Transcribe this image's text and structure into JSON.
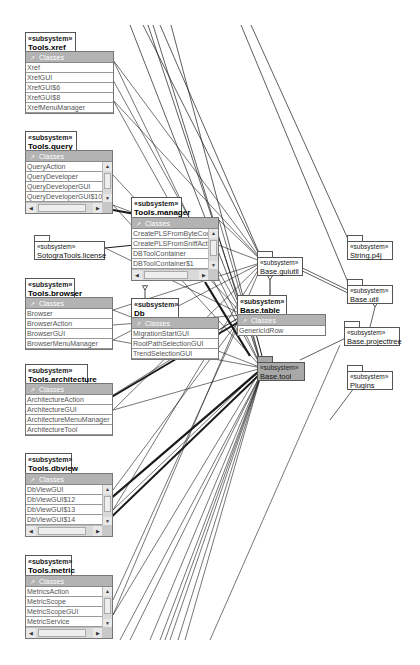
{
  "stereotype": "«subsystem»",
  "classes_label": "Classes",
  "colors": {
    "classes_header": "#b3b3b3",
    "highlight_package": "#a8a8a8",
    "line": "#1a1a1a"
  },
  "packages": [
    {
      "id": "tools_xref",
      "name": "Tools.xref",
      "classes": [
        "Xref",
        "XrefGUI",
        "XrefGUI$6",
        "XrefGUI$8",
        "XrefMenuManager"
      ]
    },
    {
      "id": "tools_query",
      "name": "Tools.query",
      "classes": [
        "QueryAction",
        "QueryDeveloper",
        "QueryDeveloperGUI",
        "QueryDeveloperGUI$10"
      ]
    },
    {
      "id": "tools_manager",
      "name": "Tools.manager",
      "classes": [
        "CreatePLSFromByteCode",
        "CreatePLSFromSniffAction",
        "DBToolContainer",
        "DBToolContainer$1"
      ]
    },
    {
      "id": "tools_browser",
      "name": "Tools.browser",
      "classes": [
        "Browser",
        "BrowserAction",
        "BrowserGUI",
        "BrowserMenuManager"
      ]
    },
    {
      "id": "db",
      "name": "Db",
      "classes": [
        "MigrationStartGUI",
        "RootPathSelectionGUI",
        "TrendSelectionGUI"
      ]
    },
    {
      "id": "base_table",
      "name": "Base.table",
      "classes": [
        "GenericIdRow"
      ]
    },
    {
      "id": "tools_architecture",
      "name": "Tools.architecture",
      "classes": [
        "ArchitectureAction",
        "ArchitectureGUI",
        "ArchitectureMenuManager",
        "ArchitectureTool"
      ]
    },
    {
      "id": "tools_dbview",
      "name": "Tools.dbview",
      "classes": [
        "DbViewGUI",
        "DbViewGUI$12",
        "DbViewGUI$13",
        "DbViewGUI$14"
      ]
    },
    {
      "id": "tools_metric",
      "name": "Tools.metric",
      "classes": [
        "MetricsAction",
        "MetricScope",
        "MetricScopeGUI",
        "MetricService"
      ]
    }
  ],
  "simple_packages": [
    {
      "id": "sotogra_license",
      "name": "SotograTools.license"
    },
    {
      "id": "base_guiutil",
      "name": "Base.guiutil"
    },
    {
      "id": "base_tool",
      "name": "Base.tool",
      "highlighted": true
    },
    {
      "id": "string_p4j",
      "name": "String.p4j"
    },
    {
      "id": "base_util",
      "name": "Base.util"
    },
    {
      "id": "base_projecttree",
      "name": "Base.projecttree"
    },
    {
      "id": "plugins",
      "name": "Plugins"
    }
  ],
  "dependencies": [
    [
      "tools_xref",
      "base_guiutil"
    ],
    [
      "tools_xref",
      "base_table"
    ],
    [
      "tools_xref",
      "base_tool"
    ],
    [
      "tools_xref",
      "base_util"
    ],
    [
      "tools_query",
      "base_guiutil"
    ],
    [
      "tools_query",
      "base_table"
    ],
    [
      "tools_query",
      "base_tool"
    ],
    [
      "tools_query",
      "tools_manager"
    ],
    [
      "tools_manager",
      "base_guiutil"
    ],
    [
      "tools_manager",
      "base_tool"
    ],
    [
      "tools_manager",
      "base_util"
    ],
    [
      "sotogra_license",
      "tools_manager"
    ],
    [
      "sotogra_license",
      "db"
    ],
    [
      "sotogra_license",
      "base_util"
    ],
    [
      "tools_browser",
      "base_guiutil"
    ],
    [
      "tools_browser",
      "base_table"
    ],
    [
      "tools_browser",
      "db"
    ],
    [
      "tools_browser",
      "base_tool"
    ],
    [
      "db",
      "base_table"
    ],
    [
      "db",
      "base_tool"
    ],
    [
      "db",
      "base_guiutil"
    ],
    [
      "base_table",
      "base_guiutil"
    ],
    [
      "base_table",
      "base_tool"
    ],
    [
      "base_tool",
      "base_util"
    ],
    [
      "base_guiutil",
      "base_util"
    ],
    [
      "tools_architecture",
      "base_tool"
    ],
    [
      "tools_architecture",
      "base_table"
    ],
    [
      "tools_architecture",
      "base_guiutil"
    ],
    [
      "tools_dbview",
      "base_tool"
    ],
    [
      "tools_dbview",
      "base_table"
    ],
    [
      "tools_dbview",
      "base_guiutil"
    ],
    [
      "tools_metric",
      "base_tool"
    ],
    [
      "tools_metric",
      "base_table"
    ],
    [
      "tools_metric",
      "base_guiutil"
    ],
    [
      "base_projecttree",
      "base_util"
    ],
    [
      "string_p4j",
      "base_util"
    ]
  ]
}
